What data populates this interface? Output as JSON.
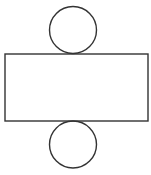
{
  "diagram": {
    "type": "cylinder-net",
    "canvas": {
      "width": 151,
      "height": 175,
      "background": "#ffffff"
    },
    "stroke_color": "#333333",
    "shapes": [
      {
        "name": "top-circle",
        "kind": "circle",
        "cx": 73,
        "cy": 30,
        "r": 23.5
      },
      {
        "name": "lateral-rectangle",
        "kind": "rect",
        "x": 5,
        "y": 54,
        "width": 143,
        "height": 67
      },
      {
        "name": "bottom-circle",
        "kind": "circle",
        "cx": 73,
        "cy": 144.5,
        "r": 23.5
      }
    ]
  }
}
